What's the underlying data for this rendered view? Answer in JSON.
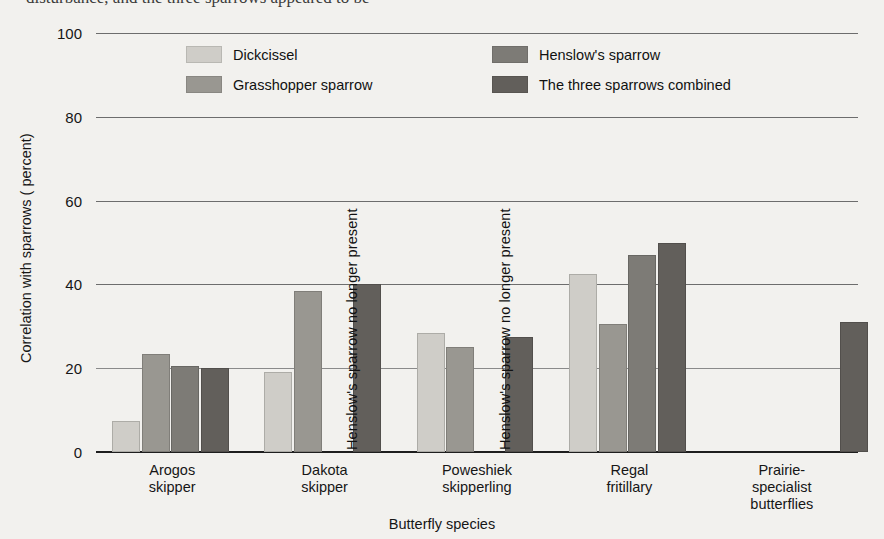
{
  "page": {
    "background": "#f2f1ee",
    "top_cut_text": "disturbance, and the three sparrows appeared to be"
  },
  "chart_data": {
    "type": "bar",
    "title": "",
    "xlabel": "Butterfly species",
    "ylabel": "Correlation with sparrows ( percent)",
    "ylim": [
      0,
      100
    ],
    "ytick_labels": [
      "0",
      "20",
      "40",
      "60",
      "80",
      "100"
    ],
    "ytick_values": [
      0,
      20,
      40,
      60,
      80,
      100
    ],
    "grid": "horizontal",
    "legend_position": "top-inside",
    "categories": [
      "Arogos skipper",
      "Dakota skipper",
      "Poweshiek skipperling",
      "Regal fritillary",
      "Prairie-specialist butterflies"
    ],
    "category_label_lines": [
      [
        "Arogos",
        "skipper"
      ],
      [
        "Dakota",
        "skipper"
      ],
      [
        "Poweshiek",
        "skipperling"
      ],
      [
        "Regal",
        "fritillary"
      ],
      [
        "Prairie-",
        "specialist",
        "butterflies"
      ]
    ],
    "series": [
      {
        "name": "Dickcissel",
        "color": "#cfcdc8",
        "values": [
          7.5,
          19,
          28.5,
          42.5,
          null
        ]
      },
      {
        "name": "Grasshopper sparrow",
        "color": "#999791",
        "values": [
          23.5,
          38.5,
          25,
          30.5,
          null
        ]
      },
      {
        "name": "Henslow's sparrow",
        "color": "#7d7b76",
        "values": [
          20.5,
          null,
          null,
          47,
          null
        ]
      },
      {
        "name": "The three sparrows combined",
        "color": "#625f5b",
        "values": [
          20,
          40,
          27.5,
          50,
          31
        ]
      }
    ],
    "annotations": [
      {
        "text": "Henslow's sparrow no longer present",
        "category": "Dakota skipper",
        "orientation": "vertical"
      },
      {
        "text": "Henslow's sparrow no longer present",
        "category": "Poweshiek skipperling",
        "orientation": "vertical"
      }
    ]
  }
}
